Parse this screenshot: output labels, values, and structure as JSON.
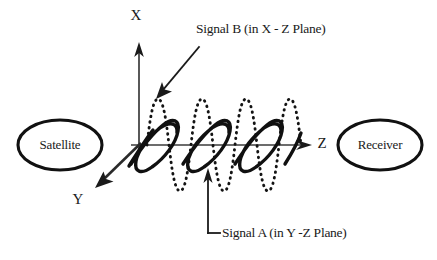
{
  "diagram": {
    "background_color": "#ffffff",
    "stroke_color": "#111111",
    "nodes": [
      {
        "id": "satellite",
        "label": "Satellite",
        "cx": 60,
        "cy": 145,
        "rx": 42,
        "ry": 25
      },
      {
        "id": "receiver",
        "label": "Receiver",
        "cx": 380,
        "cy": 145,
        "rx": 42,
        "ry": 25
      }
    ],
    "axes": [
      {
        "id": "x-axis",
        "label": "X",
        "label_x": 136,
        "label_y": 17
      },
      {
        "id": "y-axis",
        "label": "Y",
        "label_x": 78,
        "label_y": 201
      },
      {
        "id": "z-axis",
        "label": "Z",
        "label_x": 322,
        "label_y": 145
      }
    ],
    "origin": {
      "x": 139,
      "y": 145
    },
    "callouts": [
      {
        "id": "signal-b",
        "label": "Signal B (in X - Z Plane)",
        "text_x": 196,
        "text_y": 30,
        "plane": "X - Z"
      },
      {
        "id": "signal-a",
        "label": "Signal A (in Y -Z Plane)",
        "text_x": 222,
        "text_y": 234,
        "plane": "Y -Z"
      }
    ],
    "waves": [
      {
        "id": "signal-b-wave",
        "style": "dotted",
        "plane": "X - Z",
        "orientation": "vertical",
        "cycles": 3,
        "amplitude": 46,
        "wavelength": 51,
        "start_x": 148,
        "baseline_y": 145
      },
      {
        "id": "signal-a-wave",
        "style": "solid",
        "plane": "Y -Z",
        "orientation": "skewed-perspective",
        "cycles": 3,
        "amplitude": 34,
        "wavelength": 51,
        "start_x": 140,
        "baseline_y": 145
      }
    ]
  }
}
